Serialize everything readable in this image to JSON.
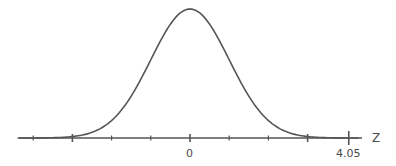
{
  "chart_data": {
    "type": "line",
    "title": "",
    "xlabel": "Z",
    "ylabel": "",
    "x_tick_labels": [
      {
        "label": "0",
        "value": 0
      },
      {
        "label": "4.05",
        "value": 4.05
      }
    ],
    "ticks": [
      -4,
      -3,
      -2,
      -1,
      0,
      1,
      2,
      3,
      4.05
    ],
    "emphasized_ticks": [
      -3,
      0,
      3,
      4.05
    ],
    "xlim": [
      -4.5,
      4.4
    ],
    "series": [
      {
        "name": "standard normal density",
        "mean": 0,
        "sd": 1,
        "x": [
          -4,
          -3,
          -2,
          -1.5,
          -1,
          -0.5,
          0,
          0.5,
          1,
          1.5,
          2,
          3,
          4
        ],
        "y": [
          0.0001,
          0.0044,
          0.054,
          0.1295,
          0.242,
          0.3521,
          0.3989,
          0.3521,
          0.242,
          0.1295,
          0.054,
          0.0044,
          0.0001
        ]
      }
    ],
    "grid": false,
    "legend": null
  },
  "axis": {
    "zero_label": "0",
    "marker_label": "4.05",
    "axis_name": "Z"
  },
  "colors": {
    "curve": "#555555",
    "axis": "#555555",
    "text": "#4a4a4a"
  }
}
